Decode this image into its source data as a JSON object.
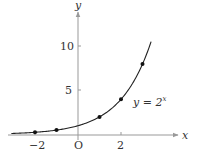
{
  "chart_data": {
    "type": "line",
    "title": "",
    "function_label": "y = 2^x",
    "function_label_base": "y = 2",
    "function_label_exp": "x",
    "xlabel": "x",
    "ylabel": "y",
    "origin_label": "O",
    "x_ticks": [
      {
        "value": -2,
        "label": "−2"
      },
      {
        "value": 2,
        "label": "2"
      }
    ],
    "y_ticks": [
      {
        "value": 5,
        "label": "5"
      },
      {
        "value": 10,
        "label": "10"
      }
    ],
    "xlim": [
      -3.1,
      4.7
    ],
    "ylim": [
      0,
      13.7
    ],
    "grid": false,
    "legend": "none",
    "series": [
      {
        "name": "y = 2^x",
        "points": [
          {
            "x": -2,
            "y": 0.25
          },
          {
            "x": -1,
            "y": 0.5
          },
          {
            "x": 1,
            "y": 2
          },
          {
            "x": 2,
            "y": 4
          },
          {
            "x": 3,
            "y": 8
          }
        ],
        "curve_domain": [
          -3.1,
          3.4
        ]
      }
    ],
    "colors": {
      "axis": "#999999",
      "curve": "#222222",
      "point": "#111111"
    }
  }
}
